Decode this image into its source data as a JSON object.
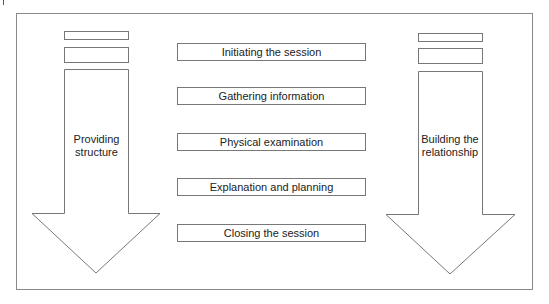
{
  "left_arrow": {
    "label_line1": "Providing",
    "label_line2": "structure"
  },
  "right_arrow": {
    "label_line1": "Building the",
    "label_line2": "relationship"
  },
  "stages": [
    "Initiating the session",
    "Gathering information",
    "Physical examination",
    "Explanation and planning",
    "Closing the session"
  ]
}
